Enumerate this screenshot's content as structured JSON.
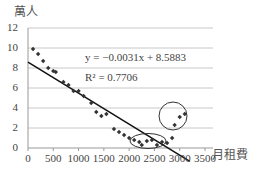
{
  "chart_data": {
    "type": "scatter",
    "title": "",
    "ylabel": "萬人",
    "xlabel": "月租費",
    "xlim": [
      0,
      3500
    ],
    "ylim": [
      0,
      12
    ],
    "xticks": [
      "0",
      "500",
      "1000",
      "1500",
      "2000",
      "2500",
      "3000",
      "3500"
    ],
    "yticks": [
      "0",
      "2",
      "4",
      "6",
      "8",
      "10",
      "12"
    ],
    "grid": "horizontal",
    "legend": "none",
    "series": [
      {
        "name": "data",
        "marker": "diamond",
        "points": [
          [
            100,
            9.9
          ],
          [
            200,
            9.4
          ],
          [
            300,
            8.7
          ],
          [
            400,
            8.0
          ],
          [
            500,
            7.7
          ],
          [
            550,
            7.6
          ],
          [
            700,
            6.6
          ],
          [
            800,
            6.3
          ],
          [
            900,
            5.7
          ],
          [
            1000,
            5.7
          ],
          [
            1100,
            5.2
          ],
          [
            1250,
            4.5
          ],
          [
            1350,
            3.6
          ],
          [
            1450,
            3.2
          ],
          [
            1550,
            3.4
          ],
          [
            1700,
            1.9
          ],
          [
            1800,
            1.6
          ],
          [
            1900,
            1.3
          ],
          [
            2000,
            1.0
          ],
          [
            2100,
            0.8
          ],
          [
            2200,
            0.6
          ],
          [
            2250,
            0.3
          ],
          [
            2350,
            0.7
          ],
          [
            2450,
            0.8
          ],
          [
            2550,
            0.3
          ],
          [
            2650,
            0.6
          ],
          [
            2750,
            0.5
          ],
          [
            2850,
            1.0
          ],
          [
            2900,
            2.3
          ],
          [
            3000,
            3.1
          ],
          [
            3100,
            3.4
          ]
        ]
      }
    ],
    "trendline": {
      "type": "linear",
      "slope": -0.0031,
      "intercept": 8.5883,
      "r2": 0.7706,
      "x_range": [
        0,
        3200
      ]
    },
    "annotations": [
      {
        "type": "ellipse",
        "label": "bottom cluster",
        "cx": 2450,
        "cy": 0.6
      },
      {
        "type": "circle",
        "label": "upturn cluster",
        "cx": 3000,
        "cy": 3.0
      },
      {
        "type": "text",
        "text": "y = −0.0031x + 8.5883"
      },
      {
        "type": "text",
        "text": "R² = 0.7706"
      }
    ]
  },
  "labels": {
    "y_title": "萬人",
    "x_title": "月租費",
    "equation": "y = −0.0031x + 8.5883",
    "r2": "R² = 0.7706"
  }
}
